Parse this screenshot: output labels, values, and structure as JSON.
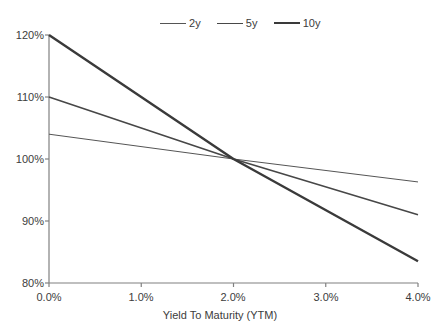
{
  "chart_data": {
    "type": "line",
    "title": "",
    "xlabel": "Yield To Maturity (YTM)",
    "ylabel": "",
    "xlim": [
      0.0,
      4.0
    ],
    "ylim": [
      80,
      120
    ],
    "grid": false,
    "legend_position": "top-center",
    "x_ticks": [
      "0.0%",
      "1.0%",
      "2.0%",
      "3.0%",
      "4.0%"
    ],
    "x_tick_values": [
      0.0,
      1.0,
      2.0,
      3.0,
      4.0
    ],
    "y_ticks": [
      "80%",
      "90%",
      "100%",
      "110%",
      "120%"
    ],
    "y_tick_values": [
      80,
      90,
      100,
      110,
      120
    ],
    "x": [
      0.0,
      2.0,
      4.0
    ],
    "series": [
      {
        "name": "2y",
        "values": [
          104.0,
          100.0,
          96.3
        ],
        "color": "#555555",
        "width": 1.0
      },
      {
        "name": "5y",
        "values": [
          110.0,
          100.0,
          91.0
        ],
        "color": "#474747",
        "width": 1.6
      },
      {
        "name": "10y",
        "values": [
          120.0,
          100.0,
          83.5
        ],
        "color": "#3a3a3a",
        "width": 2.4
      }
    ]
  },
  "legend": {
    "entries": [
      {
        "label": "2y"
      },
      {
        "label": "5y"
      },
      {
        "label": "10y"
      }
    ]
  },
  "axes": {
    "x_title": "Yield To Maturity (YTM)",
    "y_tick_labels": [
      "120%",
      "110%",
      "100%",
      "90%",
      "80%"
    ],
    "x_tick_labels": [
      "0.0%",
      "1.0%",
      "2.0%",
      "3.0%",
      "4.0%"
    ],
    "axis_color": "#808080"
  }
}
